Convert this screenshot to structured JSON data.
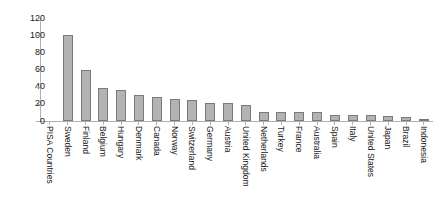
{
  "chart_data": {
    "type": "bar",
    "title": "",
    "subtitle": "",
    "xlabel": "PISA Countries",
    "ylabel": "",
    "ylim": [
      0,
      120
    ],
    "yticks": [
      0,
      20,
      40,
      60,
      80,
      100,
      120
    ],
    "grid": false,
    "legend": "none",
    "bar_color": "#b3b3b3",
    "bar_edge_color": "#7a7a7a",
    "axis_color": "#b0b0b0",
    "categories": [
      "PISA Countries",
      "Sweden",
      "Finland",
      "Belgium",
      "Hungary",
      "Denmark",
      "Canada",
      "Norway",
      "Switzerland",
      "Germany",
      "Austria",
      "United Kingdom",
      "Netherlands",
      "Turkey",
      "France",
      "Australia",
      "Spain",
      "Italy",
      "United States",
      "Japan",
      "Brazil",
      "Indonesia"
    ],
    "values": [
      null,
      100,
      59,
      38,
      36,
      30,
      28,
      26,
      25,
      21,
      20.5,
      19,
      11,
      11,
      10.5,
      10,
      7,
      7,
      6.5,
      5.5,
      5,
      2
    ]
  }
}
